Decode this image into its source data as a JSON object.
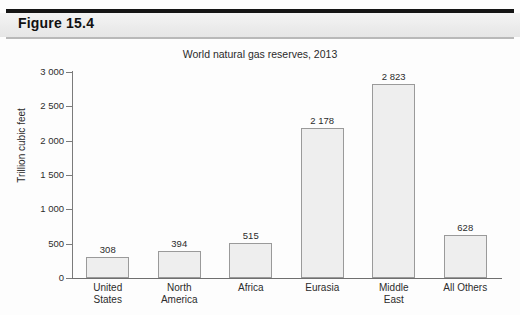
{
  "header": {
    "figure_label": "Figure 15.4"
  },
  "chart_data": {
    "type": "bar",
    "title": "World natural gas reserves, 2013",
    "xlabel": "",
    "ylabel": "Trillion cubic feet",
    "ylim": [
      0,
      3000
    ],
    "ytick_labels": [
      "3 000",
      "2 500",
      "2 000",
      "1 500",
      "1 000",
      "500",
      "0"
    ],
    "ytick_values": [
      3000,
      2500,
      2000,
      1500,
      1000,
      500,
      0
    ],
    "grid": false,
    "legend": "none",
    "categories": [
      "United\nStates",
      "North\nAmerica",
      "Africa",
      "Eurasia",
      "Middle\nEast",
      "All Others"
    ],
    "values": [
      308,
      394,
      515,
      2178,
      2823,
      628
    ],
    "value_labels": [
      "308",
      "394",
      "515",
      "2 178",
      "2 823",
      "628"
    ],
    "bar_fill": "#eeeeee",
    "bar_stroke": "#9a9a9a"
  }
}
